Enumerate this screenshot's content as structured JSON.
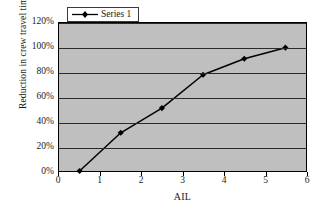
{
  "chart_data": {
    "type": "line",
    "title": "",
    "xlabel": "AIL",
    "ylabel": "Reduction in crew travel time",
    "xlim": [
      0,
      6
    ],
    "ylim": [
      0,
      1.2
    ],
    "grid": true,
    "legend_position": "top-left-inside",
    "x_ticks": [
      "0",
      "1",
      "2",
      "3",
      "4",
      "5",
      "6"
    ],
    "x_tick_values": [
      0,
      1,
      2,
      3,
      4,
      5,
      6
    ],
    "y_ticks": [
      "0%",
      "20%",
      "40%",
      "60%",
      "80%",
      "100%",
      "120%"
    ],
    "y_tick_values": [
      0,
      0.2,
      0.4,
      0.6,
      0.8,
      1.0,
      1.2
    ],
    "series": [
      {
        "name": "Series 1",
        "marker": "diamond",
        "color": "#000000",
        "x": [
          0.5,
          1.5,
          2.5,
          3.5,
          4.5,
          5.5
        ],
        "values": [
          0.0,
          0.31,
          0.51,
          0.78,
          0.91,
          1.0
        ],
        "labels": [
          "0%",
          "31%",
          "51%",
          "78%",
          "91%",
          "100%"
        ]
      }
    ],
    "plot_background": "#bfbfbf",
    "figure_background": "#ffffff",
    "axis_color": "#000000",
    "gridline_color": "#2a2a2a"
  },
  "legend": {
    "entries": [
      {
        "label": "Series 1",
        "marker": "diamond-line-marker"
      }
    ]
  }
}
